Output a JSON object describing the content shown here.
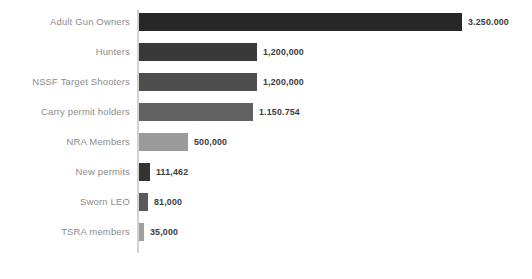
{
  "chart_data": {
    "type": "bar",
    "orientation": "horizontal",
    "title": "",
    "subtitle": "",
    "xlabel": "",
    "ylabel": "",
    "grid": false,
    "legend": "none",
    "axis_line": "vertical category axis at left of bars",
    "xlim": [
      0,
      3250000
    ],
    "categories": [
      "Adult Gun Owners",
      "Hunters",
      "NSSF Target Shooters",
      "Carry permit holders",
      "NRA Members",
      "New permits",
      "Sworn LEO",
      "TSRA members"
    ],
    "values": [
      3250000,
      1200000,
      1200000,
      1150754,
      500000,
      111462,
      81000,
      35000
    ],
    "value_labels": [
      "3.250.000",
      "1,200,000",
      "1,200,000",
      "1.150.754",
      "500,000",
      "111,462",
      "81,000",
      "35,000"
    ],
    "bar_colors": [
      "#272727",
      "#393939",
      "#4e4e4e",
      "#626262",
      "#9a9a9a",
      "#333333",
      "#5a5a5a",
      "#a0a0a0"
    ],
    "bar_pixel_widths": [
      323,
      118,
      118,
      114,
      49,
      11,
      9,
      5
    ]
  },
  "style": {
    "background": "#ffffff",
    "axis_color": "#d2d2d2",
    "category_label_color": "#8c8c8c",
    "value_label_color": "#3b3b3b"
  }
}
